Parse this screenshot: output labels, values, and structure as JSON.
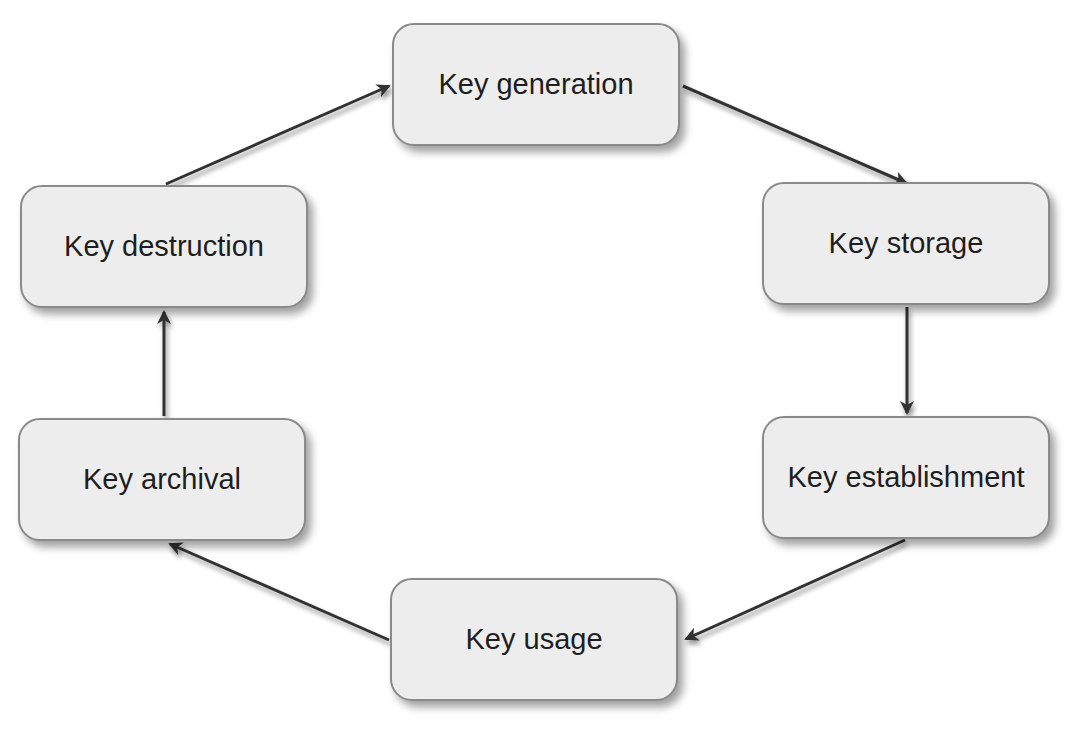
{
  "diagram": {
    "type": "cycle",
    "nodes": [
      {
        "id": "generation",
        "label": "Key generation"
      },
      {
        "id": "storage",
        "label": "Key storage"
      },
      {
        "id": "establishment",
        "label": "Key establishment"
      },
      {
        "id": "usage",
        "label": "Key usage"
      },
      {
        "id": "archival",
        "label": "Key archival"
      },
      {
        "id": "destruction",
        "label": "Key destruction"
      }
    ],
    "edges": [
      {
        "from": "generation",
        "to": "storage"
      },
      {
        "from": "storage",
        "to": "establishment"
      },
      {
        "from": "establishment",
        "to": "usage"
      },
      {
        "from": "usage",
        "to": "archival"
      },
      {
        "from": "archival",
        "to": "destruction"
      },
      {
        "from": "destruction",
        "to": "generation"
      }
    ],
    "colors": {
      "node_fill": "#ededed",
      "node_border": "#8a8a8a",
      "arrow": "#333333",
      "text": "#1e1e1e"
    }
  }
}
